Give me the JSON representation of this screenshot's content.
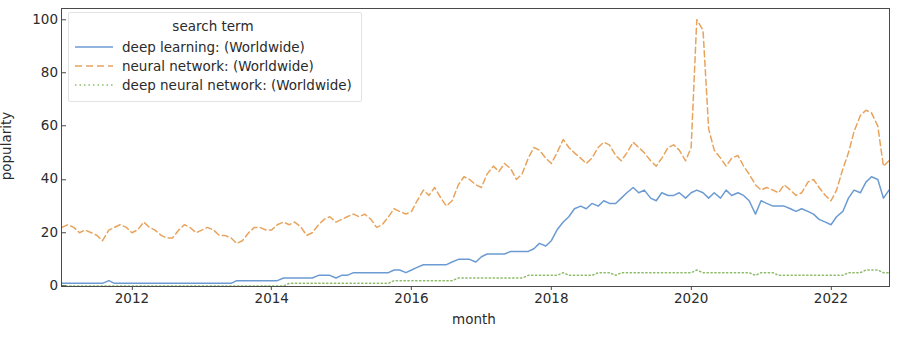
{
  "chart_data": {
    "type": "line",
    "title": "",
    "subtitle": "",
    "xlabel": "month",
    "ylabel": "popularity",
    "xlim": [
      2011.0,
      2022.83
    ],
    "ylim": [
      0,
      104
    ],
    "grid": false,
    "legend_position": "upper left",
    "legend_title": "search term",
    "xtick_labels": [
      "2012",
      "2014",
      "2016",
      "2018",
      "2020",
      "2022"
    ],
    "xtick_values": [
      2012,
      2014,
      2016,
      2018,
      2020,
      2022
    ],
    "ytick_labels": [
      "0",
      "20",
      "40",
      "60",
      "80",
      "100"
    ],
    "ytick_values": [
      0,
      20,
      40,
      60,
      80,
      100
    ],
    "x": [
      2011.0,
      2011.08,
      2011.17,
      2011.25,
      2011.33,
      2011.42,
      2011.5,
      2011.58,
      2011.67,
      2011.75,
      2011.83,
      2011.92,
      2012.0,
      2012.08,
      2012.17,
      2012.25,
      2012.33,
      2012.42,
      2012.5,
      2012.58,
      2012.67,
      2012.75,
      2012.83,
      2012.92,
      2013.0,
      2013.08,
      2013.17,
      2013.25,
      2013.33,
      2013.42,
      2013.5,
      2013.58,
      2013.67,
      2013.75,
      2013.83,
      2013.92,
      2014.0,
      2014.08,
      2014.17,
      2014.25,
      2014.33,
      2014.42,
      2014.5,
      2014.58,
      2014.67,
      2014.75,
      2014.83,
      2014.92,
      2015.0,
      2015.08,
      2015.17,
      2015.25,
      2015.33,
      2015.42,
      2015.5,
      2015.58,
      2015.67,
      2015.75,
      2015.83,
      2015.92,
      2016.0,
      2016.08,
      2016.17,
      2016.25,
      2016.33,
      2016.42,
      2016.5,
      2016.58,
      2016.67,
      2016.75,
      2016.83,
      2016.92,
      2017.0,
      2017.08,
      2017.17,
      2017.25,
      2017.33,
      2017.42,
      2017.5,
      2017.58,
      2017.67,
      2017.75,
      2017.83,
      2017.92,
      2018.0,
      2018.08,
      2018.17,
      2018.25,
      2018.33,
      2018.42,
      2018.5,
      2018.58,
      2018.67,
      2018.75,
      2018.83,
      2018.92,
      2019.0,
      2019.08,
      2019.17,
      2019.25,
      2019.33,
      2019.42,
      2019.5,
      2019.58,
      2019.67,
      2019.75,
      2019.83,
      2019.92,
      2020.0,
      2020.08,
      2020.17,
      2020.25,
      2020.33,
      2020.42,
      2020.5,
      2020.58,
      2020.67,
      2020.75,
      2020.83,
      2020.92,
      2021.0,
      2021.08,
      2021.17,
      2021.25,
      2021.33,
      2021.42,
      2021.5,
      2021.58,
      2021.67,
      2021.75,
      2021.83,
      2021.92,
      2022.0,
      2022.08,
      2022.17,
      2022.25,
      2022.33,
      2022.42,
      2022.5,
      2022.58,
      2022.67,
      2022.75,
      2022.83
    ],
    "series": [
      {
        "name": "deep learning: (Worldwide)",
        "color": "#6b9bd2",
        "linestyle": "solid",
        "values": [
          1,
          1,
          1,
          1,
          1,
          1,
          1,
          1,
          2,
          1,
          1,
          1,
          1,
          1,
          1,
          1,
          1,
          1,
          1,
          1,
          1,
          1,
          1,
          1,
          1,
          1,
          1,
          1,
          1,
          1,
          2,
          2,
          2,
          2,
          2,
          2,
          2,
          2,
          3,
          3,
          3,
          3,
          3,
          3,
          4,
          4,
          4,
          3,
          4,
          4,
          5,
          5,
          5,
          5,
          5,
          5,
          5,
          6,
          6,
          5,
          6,
          7,
          8,
          8,
          8,
          8,
          8,
          9,
          10,
          10,
          10,
          9,
          11,
          12,
          12,
          12,
          12,
          13,
          13,
          13,
          13,
          14,
          16,
          15,
          17,
          21,
          24,
          26,
          29,
          30,
          29,
          31,
          30,
          32,
          31,
          31,
          33,
          35,
          37,
          35,
          36,
          33,
          32,
          35,
          34,
          34,
          35,
          33,
          35,
          36,
          35,
          33,
          35,
          33,
          36,
          34,
          35,
          34,
          32,
          27,
          32,
          31,
          30,
          30,
          30,
          29,
          28,
          29,
          28,
          27,
          25,
          24,
          23,
          26,
          28,
          33,
          36,
          35,
          39,
          41,
          40,
          33,
          36
        ]
      },
      {
        "name": "neural network: (Worldwide)",
        "color": "#e8a35c",
        "linestyle": "dashed",
        "values": [
          22,
          23,
          22,
          20,
          21,
          20,
          19,
          17,
          21,
          22,
          23,
          22,
          20,
          21,
          24,
          22,
          21,
          19,
          18,
          18,
          21,
          23,
          22,
          20,
          21,
          22,
          21,
          19,
          19,
          18,
          16,
          17,
          20,
          22,
          22,
          21,
          21,
          23,
          24,
          23,
          24,
          22,
          19,
          20,
          23,
          25,
          26,
          24,
          25,
          26,
          27,
          26,
          27,
          25,
          22,
          23,
          26,
          29,
          28,
          27,
          28,
          32,
          36,
          34,
          37,
          33,
          30,
          32,
          38,
          41,
          40,
          38,
          37,
          42,
          45,
          43,
          46,
          44,
          40,
          42,
          48,
          52,
          51,
          48,
          46,
          50,
          55,
          52,
          50,
          48,
          46,
          48,
          52,
          54,
          53,
          49,
          47,
          50,
          54,
          52,
          50,
          47,
          45,
          48,
          52,
          53,
          51,
          47,
          52,
          100,
          96,
          59,
          51,
          48,
          45,
          48,
          49,
          45,
          42,
          38,
          36,
          37,
          36,
          35,
          38,
          36,
          34,
          35,
          39,
          40,
          37,
          34,
          32,
          36,
          44,
          50,
          58,
          64,
          66,
          65,
          60,
          45,
          47
        ]
      },
      {
        "name": "deep neural network: (Worldwide)",
        "color": "#8fbc6b",
        "linestyle": "dotted",
        "values": [
          0,
          0,
          0,
          0,
          0,
          0,
          0,
          0,
          0,
          0,
          0,
          0,
          0,
          0,
          0,
          0,
          0,
          0,
          0,
          0,
          0,
          0,
          0,
          0,
          0,
          0,
          0,
          0,
          0,
          0,
          0,
          0,
          0,
          0,
          0,
          0,
          0,
          0,
          0,
          1,
          1,
          1,
          1,
          1,
          1,
          1,
          1,
          1,
          1,
          1,
          1,
          1,
          1,
          1,
          1,
          1,
          1,
          2,
          2,
          2,
          2,
          2,
          2,
          2,
          2,
          2,
          2,
          2,
          3,
          3,
          3,
          3,
          3,
          3,
          3,
          3,
          3,
          3,
          3,
          3,
          4,
          4,
          4,
          4,
          4,
          4,
          5,
          4,
          4,
          4,
          4,
          4,
          5,
          5,
          5,
          4,
          5,
          5,
          5,
          5,
          5,
          5,
          5,
          5,
          5,
          5,
          5,
          5,
          5,
          6,
          5,
          5,
          5,
          5,
          5,
          5,
          5,
          5,
          5,
          4,
          5,
          5,
          5,
          4,
          4,
          4,
          4,
          4,
          4,
          4,
          4,
          4,
          4,
          4,
          4,
          5,
          5,
          5,
          6,
          6,
          6,
          5,
          5
        ]
      }
    ]
  },
  "legend": {
    "title": "search term",
    "items": [
      {
        "label": "deep learning: (Worldwide)"
      },
      {
        "label": "neural network: (Worldwide)"
      },
      {
        "label": "deep neural network: (Worldwide)"
      }
    ]
  },
  "axes": {
    "ylabel": "popularity",
    "xlabel": "month"
  },
  "colors": {
    "series_blue": "#6b9bd2",
    "series_orange": "#e8a35c",
    "series_green": "#8fbc6b",
    "axis": "#4a4a4a",
    "text": "#2b2b2b",
    "background": "#ffffff"
  }
}
